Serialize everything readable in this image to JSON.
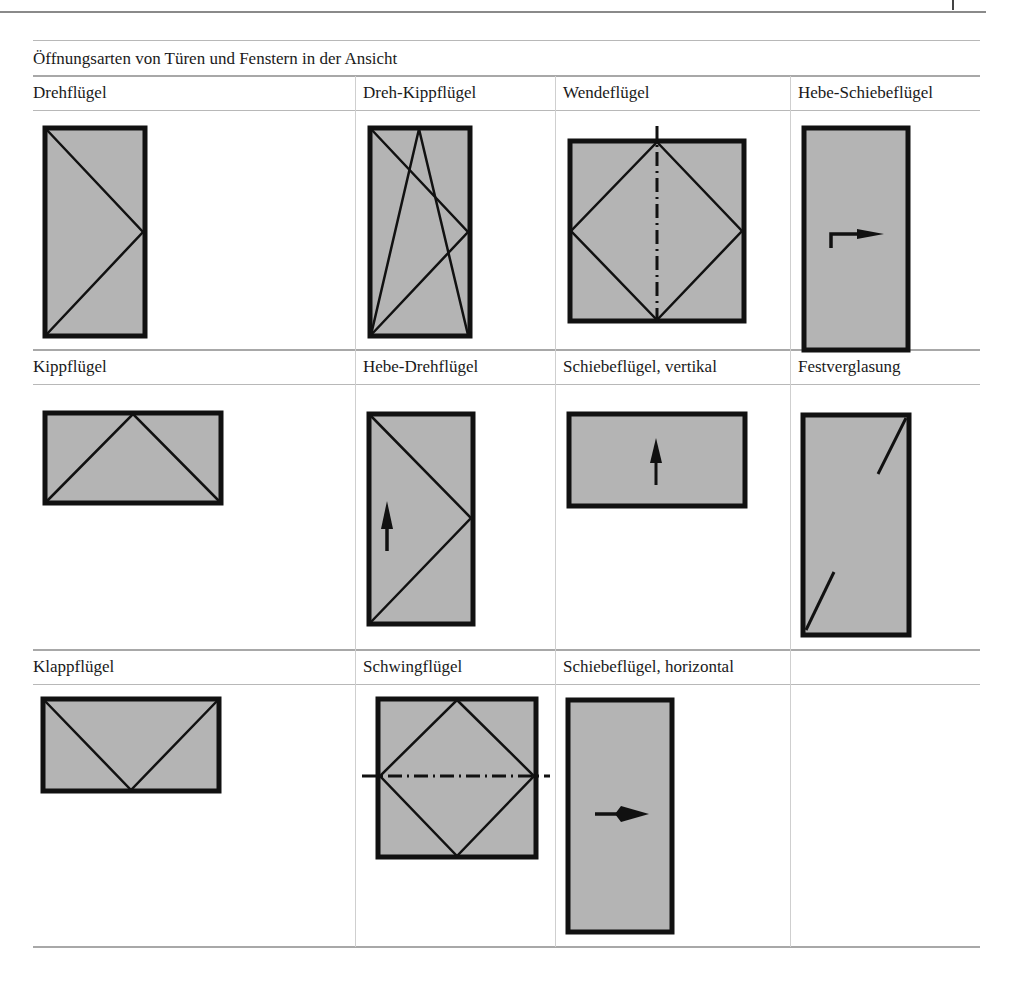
{
  "page": {
    "table_title": "Öffnungsarten von Türen und Fenstern in der Ansicht"
  },
  "colors": {
    "pane_fill": "#b4b4b4",
    "frame_stroke": "#111111",
    "rule_color": "#a8a8a8"
  },
  "rows": [
    {
      "cells": [
        {
          "label": "Drehflügel",
          "symbol": "side-hung-left-hinge-icon"
        },
        {
          "label": "Dreh-Kippflügel",
          "symbol": "tilt-turn-icon"
        },
        {
          "label": "Wendeflügel",
          "symbol": "vertical-pivot-icon"
        },
        {
          "label": "Hebe-Schiebeflügel",
          "symbol": "lift-slide-icon"
        }
      ]
    },
    {
      "cells": [
        {
          "label": "Kippflügel",
          "symbol": "bottom-hung-tilt-icon"
        },
        {
          "label": "Hebe-Drehflügel",
          "symbol": "lift-turn-icon"
        },
        {
          "label": "Schiebeflügel, vertikal",
          "symbol": "vertical-slide-icon"
        },
        {
          "label": "Festverglasung",
          "symbol": "fixed-glazing-icon"
        }
      ]
    },
    {
      "cells": [
        {
          "label": "Klappflügel",
          "symbol": "top-hung-icon"
        },
        {
          "label": "Schwingflügel",
          "symbol": "horizontal-pivot-icon"
        },
        {
          "label": "Schiebeflügel, horizontal",
          "symbol": "horizontal-slide-icon"
        },
        {
          "label": "",
          "symbol": ""
        }
      ]
    }
  ]
}
